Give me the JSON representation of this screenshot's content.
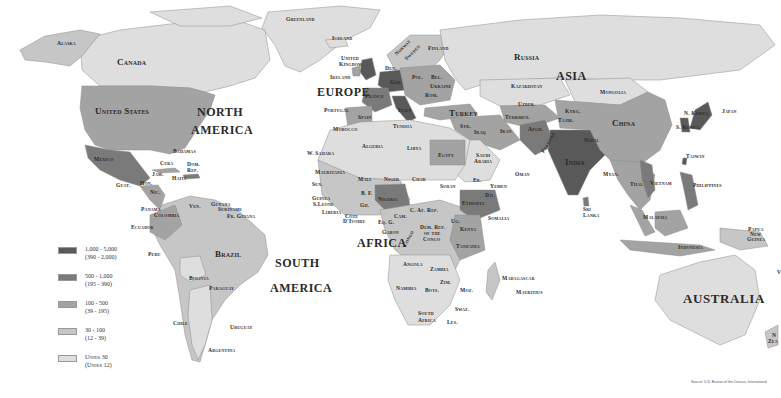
{
  "map": {
    "title": "World Population Density",
    "legend": [
      {
        "range": "1,000 - 5,000",
        "sub": "(390 - 2,000)",
        "color": "#595959"
      },
      {
        "range": "500 - 1,000",
        "sub": "(195 - 390)",
        "color": "#7a7a7a"
      },
      {
        "range": "100 - 500",
        "sub": "(39 - 195)",
        "color": "#a3a3a3"
      },
      {
        "range": "30 - 100",
        "sub": "(12 - 39)",
        "color": "#c6c6c6"
      },
      {
        "range": "Under 30",
        "sub": "(Under 12)",
        "color": "#dedede"
      }
    ],
    "source": "Source: U.S. Bureau of the Census, International",
    "continents": {
      "north_america_1": "NORTH",
      "north_america_2": "AMERICA",
      "south_america_1": "SOUTH",
      "south_america_2": "AMERICA",
      "europe": "EUROPE",
      "asia": "ASIA",
      "africa": "AFRICA",
      "australia": "AUSTRALIA"
    },
    "countries": {
      "alaska": "Alaska",
      "canada": "Canada",
      "greenland": "Greenland",
      "united_states": "United States",
      "mexico": "Mexico",
      "bahamas": "Bahamas",
      "cuba": "Cuba",
      "dom_rep_1": "Dom.",
      "dom_rep_2": "Rep.",
      "jam": "Jam.",
      "haiti": "Haiti",
      "guat": "Guat.",
      "hon": "Hon.",
      "nic": "Nic.",
      "panama": "Panama",
      "colombia": "Colombia",
      "ven": "Ven.",
      "guyana": "Guyana",
      "suriname": "Suriname",
      "fr_guiana": "Fr. Guiana",
      "ecuador": "Ecuador",
      "peru": "Peru",
      "brazil": "Brazil",
      "bolivia": "Bolivia",
      "paraguay": "Paraguay",
      "chile": "Chile",
      "uruguay": "Uruguay",
      "argentina": "Argentina",
      "iceland": "Iceland",
      "norway": "Norway",
      "sweden": "Sweden",
      "finland": "Finland",
      "uk_1": "United",
      "uk_2": "Kingdom",
      "ireland": "Ireland",
      "den": "Den.",
      "ger": "Ger.",
      "pol": "Pol.",
      "bel": "Bel.",
      "ukraine": "Ukraine",
      "france": "France",
      "rom": "Rom.",
      "portugal": "Portugal",
      "spain": "Spain",
      "italy": "Italy",
      "morocco": "Morocco",
      "tunisia": "Tunisia",
      "turkey": "Turkey",
      "syr": "Syr.",
      "iraq": "Iraq",
      "iran": "Iran",
      "russia": "Russia",
      "kazakhstan": "Kazakhstan",
      "uzbek": "Uzbek.",
      "turkmen": "Turkmen.",
      "kyrg": "Kyrg.",
      "tajik": "Tajik.",
      "afgh": "Afgh.",
      "pakistan": "Pakistan",
      "mongolia": "Mongolia",
      "china": "China",
      "nepal": "Nepal",
      "india": "India",
      "n_korea": "N. Korea",
      "s_korea": "S. Korea",
      "japan": "Japan",
      "taiwan": "Taiwan",
      "myan": "Myan.",
      "thai": "Thai.",
      "vietnam": "Vietnam",
      "philippines": "Philippines",
      "sri_lanka_1": "Sri",
      "sri_lanka_2": "Lanka",
      "malaysia": "Malaysia",
      "indonesia": "Indonesia",
      "png_1": "Papua",
      "png_2": "New",
      "png_3": "Guinea",
      "nz_1": "N",
      "nz_2": "Zea",
      "saudi_1": "Saudi",
      "saudi_2": "Arabia",
      "oman": "Oman",
      "yemen": "Yemen",
      "er": "Er.",
      "dji": "Dji.",
      "w_sahara": "W. Sahara",
      "algeria": "Algeria",
      "libya": "Libya",
      "egypt": "Egypt",
      "mauritania": "Mauritania",
      "mali": "Mali",
      "niger": "Niger",
      "chad": "Chad",
      "sudan": "Sudan",
      "sen": "Sen.",
      "guinea": "Guinea",
      "s_leone": "S.Leone",
      "liberia": "Liberia",
      "cote_1": "Côte",
      "cote_2": "D'Ivoire",
      "bf": "B. F.",
      "gh": "Gh.",
      "nigeria": "Nigeria",
      "cam": "Cam.",
      "car": "C. Af. Rep.",
      "eq_g": "Eq. G.",
      "gabon": "Gabon",
      "congo": "Congo",
      "drc_1": "Dem. Rep.",
      "drc_2": "of the",
      "drc_3": "Congo",
      "ethiopia": "Ethiopia",
      "somalia": "Somalia",
      "ug": "Ug.",
      "kenya": "Kenya",
      "tanzania": "Tanzania",
      "angola": "Angola",
      "zambia": "Zambia",
      "zim": "Zim.",
      "moz": "Moz.",
      "namibia": "Namibia",
      "bots": "Bots.",
      "swaz": "Swaz.",
      "south_africa_1": "South",
      "south_africa_2": "Africa",
      "les": "Les.",
      "madagascar": "Madagascar",
      "mauritius": "Mauritius",
      "v": "V"
    }
  }
}
